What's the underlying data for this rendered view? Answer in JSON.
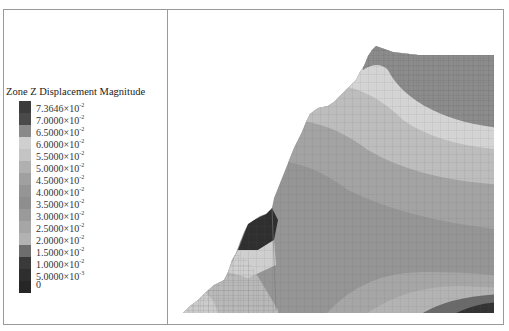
{
  "legend": {
    "title": "Zone Z Displacement Magnitude",
    "entries": [
      {
        "mantissa": "7.3646",
        "times": "×10",
        "exp": "-2",
        "color": "#3c3c3c"
      },
      {
        "mantissa": "7.0000",
        "times": "×10",
        "exp": "-2",
        "color": "#4a4a4a"
      },
      {
        "mantissa": "6.5000",
        "times": "×10",
        "exp": "-2",
        "color": "#8a8a8a"
      },
      {
        "mantissa": "6.0000",
        "times": "×10",
        "exp": "-2",
        "color": "#cfcfcf"
      },
      {
        "mantissa": "5.5000",
        "times": "×10",
        "exp": "-2",
        "color": "#c4c4c4"
      },
      {
        "mantissa": "5.0000",
        "times": "×10",
        "exp": "-2",
        "color": "#b0b0b0"
      },
      {
        "mantissa": "4.5000",
        "times": "×10",
        "exp": "-2",
        "color": "#a0a0a0"
      },
      {
        "mantissa": "4.0000",
        "times": "×10",
        "exp": "-2",
        "color": "#959595"
      },
      {
        "mantissa": "3.5000",
        "times": "×10",
        "exp": "-2",
        "color": "#8e8e8e"
      },
      {
        "mantissa": "3.0000",
        "times": "×10",
        "exp": "-2",
        "color": "#9a9a9a"
      },
      {
        "mantissa": "2.5000",
        "times": "×10",
        "exp": "-2",
        "color": "#a6a6a6"
      },
      {
        "mantissa": "2.0000",
        "times": "×10",
        "exp": "-2",
        "color": "#b2b2b2"
      },
      {
        "mantissa": "1.5000",
        "times": "×10",
        "exp": "-2",
        "color": "#6e6e6e"
      },
      {
        "mantissa": "1.0000",
        "times": "×10",
        "exp": "-2",
        "color": "#3a3a3a"
      },
      {
        "mantissa": "5.0000",
        "times": "×10",
        "exp": "-3",
        "color": "#2e2e2e"
      },
      {
        "mantissa": "0",
        "times": "",
        "exp": "",
        "color": "#262626"
      }
    ]
  },
  "plot": {
    "description": "Contour plot of vertical displacement magnitude over a meshed slope model",
    "colors": {
      "top_zone": "#8c8c8c",
      "light_band": "#d4d4d4",
      "mid_light": "#bdbdbd",
      "mid": "#a3a3a3",
      "main": "#959595",
      "dark_toe": "#2f2f2f",
      "bottom_dark": "#3a3a3a"
    }
  }
}
